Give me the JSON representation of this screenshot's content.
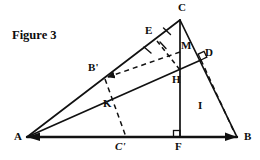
{
  "figure": {
    "caption": "Figure 3",
    "background_color": "#ffffff",
    "stroke_color": "#111111",
    "width": 260,
    "height": 160,
    "points": {
      "A": {
        "x": 27,
        "y": 137,
        "label": "A",
        "label_x": 14,
        "label_y": 131
      },
      "B": {
        "x": 237,
        "y": 137,
        "label": "B",
        "label_x": 244,
        "label_y": 131
      },
      "C": {
        "x": 180,
        "y": 20,
        "label": "C",
        "label_x": 181,
        "label_y": 3
      },
      "D": {
        "x": 201,
        "y": 60,
        "label": "D",
        "label_x": 205,
        "label_y": 48
      },
      "E": {
        "x": 157,
        "y": 41,
        "label": "E",
        "label_x": 146,
        "label_y": 26
      },
      "F": {
        "x": 180,
        "y": 137,
        "label": "F",
        "label_x": 176,
        "label_y": 143
      },
      "H": {
        "x": 180,
        "y": 70,
        "label": "H",
        "label_x": 175,
        "label_y": 74
      },
      "I": {
        "x": 207,
        "y": 103,
        "label": "I",
        "label_x": 199,
        "label_y": 104
      },
      "K": {
        "x": 118,
        "y": 97,
        "label": "K",
        "label_x": 104,
        "label_y": 99
      },
      "M": {
        "x": 180,
        "y": 52,
        "label": "M",
        "label_x": 182,
        "label_y": 41
      },
      "Bprime": {
        "x": 105,
        "y": 79,
        "label": "B'",
        "label_x": 90,
        "label_y": 63
      },
      "Cprime": {
        "x": 126,
        "y": 137,
        "label": "C'",
        "label_x": 116,
        "label_y": 143
      }
    },
    "solid_segments": [
      {
        "name": "base-AB",
        "from": "A",
        "to": "B"
      },
      {
        "name": "side-AC",
        "from": "A",
        "to": "C"
      },
      {
        "name": "side-CB",
        "from": "C",
        "to": "B"
      },
      {
        "name": "altitude-CF",
        "from": "C",
        "to": "F"
      },
      {
        "name": "cevian-AD",
        "from": "A",
        "to": "D"
      }
    ],
    "dashed_segments": [
      {
        "name": "dashed-EH",
        "from": "E",
        "to": "H"
      },
      {
        "name": "dashed-Bprime-M",
        "from": "Bprime",
        "to": "M"
      },
      {
        "name": "dashed-Bprime-Cprime",
        "from": "Bprime",
        "to": "Cprime"
      },
      {
        "name": "dashed-D-B",
        "from": "D",
        "to": "B"
      }
    ],
    "right_angles": [
      {
        "name": "right-angle-at-F",
        "x": 180,
        "y": 137,
        "note": "CF perpendicular to AB"
      },
      {
        "name": "right-angle-at-D",
        "x": 201,
        "y": 60,
        "note": "AD perpendicular to CB"
      }
    ],
    "arrow_heads": [
      {
        "name": "arrowhead-at-Bprime",
        "x": 105,
        "y": 79
      },
      {
        "name": "arrowhead-at-A",
        "x": 27,
        "y": 137
      },
      {
        "name": "arrowhead-at-B",
        "x": 237,
        "y": 137
      }
    ],
    "tick_marks": [
      {
        "name": "tick-on-CE",
        "note": "congruence tick on segment C-E"
      },
      {
        "name": "tick-on-EH",
        "note": "congruence tick on segment E-H"
      }
    ]
  }
}
